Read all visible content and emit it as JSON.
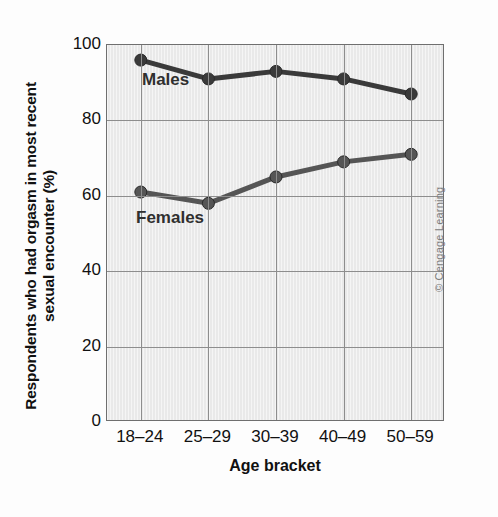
{
  "chart_data": {
    "type": "line",
    "title": "",
    "xlabel": "Age bracket",
    "ylabel": "Respondents who had orgasm in most recent\nsexual encounter (%)",
    "categories": [
      "18–24",
      "25–29",
      "30–39",
      "40–49",
      "50–59"
    ],
    "series": [
      {
        "name": "Males",
        "values": [
          96,
          91,
          93,
          91,
          87
        ],
        "color": "#3a3a3a"
      },
      {
        "name": "Females",
        "values": [
          61,
          58,
          65,
          69,
          71
        ],
        "color": "#555555"
      }
    ],
    "ylim": [
      0,
      100
    ],
    "yticks": [
      0,
      20,
      40,
      60,
      80,
      100
    ],
    "ytick_labels": [
      "0",
      "20",
      "40",
      "60",
      "80",
      "100"
    ],
    "grid": true,
    "legend": "inline-labels",
    "plot_background": "#e9e9e9",
    "grid_color": "#8d8d8d",
    "axis_color": "#6f6f6f"
  },
  "annotations": {
    "males_label": "Males",
    "females_label": "Females"
  },
  "footer": {
    "copyright": "© Cengage Learning"
  }
}
